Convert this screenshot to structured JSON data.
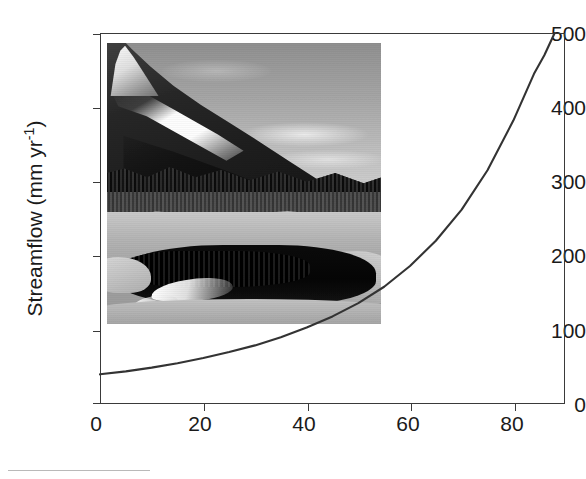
{
  "chart_data": {
    "type": "line",
    "title": "",
    "subtitle": "",
    "xlabel": "Snow cover (% of days from January through June)",
    "ylabel": "Streamflow (mm yr",
    "ylabel_sup": "-1",
    "ylabel_suffix": ")",
    "xlim": [
      0,
      90
    ],
    "ylim": [
      0,
      500
    ],
    "xticks": [
      0,
      20,
      40,
      60,
      80
    ],
    "yticks": [
      0,
      100,
      200,
      300,
      400,
      500
    ],
    "grid": false,
    "legend": "none",
    "series": [
      {
        "name": "Streamflow vs snow cover",
        "color": "#333333",
        "line_width": 2,
        "x": [
          0,
          5,
          10,
          15,
          20,
          25,
          30,
          35,
          40,
          45,
          50,
          55,
          60,
          65,
          70,
          75,
          80,
          84,
          86,
          88
        ],
        "y": [
          40,
          44,
          49,
          55,
          62,
          70,
          79,
          90,
          103,
          118,
          136,
          158,
          186,
          220,
          262,
          315,
          382,
          445,
          470,
          500
        ]
      }
    ],
    "annotations": [
      {
        "name": "inset-photograph",
        "kind": "image",
        "description": "Black-and-white photograph of a snow-covered mountain ridge with conifer forest above a partly frozen pond reflecting snow",
        "x_range": [
          1.4,
          54.5
        ],
        "y_range": [
          107,
          500
        ]
      }
    ]
  },
  "axes": {
    "y_tick_labels": [
      "500",
      "400",
      "300",
      "200",
      "100",
      "0"
    ],
    "x_tick_labels": [
      "0",
      "20",
      "40",
      "60",
      "80"
    ]
  },
  "figure": {
    "caption_rule_present": true,
    "background_color": "#ffffff",
    "axis_color": "#3a3a3a",
    "text_color": "#1a1a1a"
  }
}
